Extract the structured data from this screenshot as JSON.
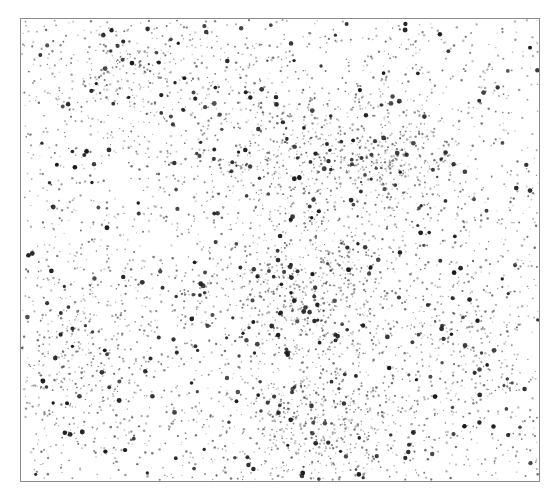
{
  "chart_data": {
    "type": "scatter",
    "title": "",
    "xlabel": "",
    "ylabel": "",
    "grid": false,
    "legend": null,
    "frame": {
      "left": 20,
      "top": 18,
      "right": 540,
      "bottom": 482,
      "border_color": "#8a8a8a"
    },
    "point_color": "#1a1a1a",
    "background_points": 2600,
    "seed": 1337,
    "clusters": [
      {
        "name": "upper-left",
        "cx": 0.22,
        "cy": 0.13,
        "sx": 0.09,
        "sy": 0.07,
        "n": 260
      },
      {
        "name": "upper-center",
        "cx": 0.5,
        "cy": 0.28,
        "sx": 0.09,
        "sy": 0.09,
        "n": 320
      },
      {
        "name": "upper-right",
        "cx": 0.72,
        "cy": 0.3,
        "sx": 0.07,
        "sy": 0.08,
        "n": 380
      },
      {
        "name": "center",
        "cx": 0.55,
        "cy": 0.58,
        "sx": 0.11,
        "sy": 0.09,
        "n": 620
      },
      {
        "name": "left",
        "cx": 0.12,
        "cy": 0.72,
        "sx": 0.08,
        "sy": 0.1,
        "n": 320
      },
      {
        "name": "bottom-center",
        "cx": 0.58,
        "cy": 0.88,
        "sx": 0.1,
        "sy": 0.07,
        "n": 460
      },
      {
        "name": "right",
        "cx": 0.86,
        "cy": 0.72,
        "sx": 0.07,
        "sy": 0.1,
        "n": 200
      }
    ]
  }
}
